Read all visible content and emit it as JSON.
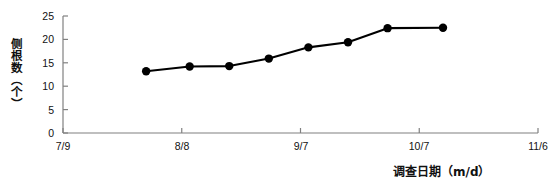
{
  "chart_data": {
    "type": "line",
    "title": "",
    "xlabel": "调查日期（m/d）",
    "ylabel": "侧根数（个）",
    "x_tick_labels": [
      "7/9",
      "8/8",
      "9/7",
      "10/7",
      "11/6"
    ],
    "x_tick_days": [
      0,
      30,
      60,
      90,
      120
    ],
    "xlim_labels": [
      "7/9",
      "11/6"
    ],
    "y_tick_labels": [
      "0",
      "5",
      "10",
      "15",
      "20",
      "25"
    ],
    "y_ticks": [
      0,
      5,
      10,
      15,
      20,
      25
    ],
    "ylim": [
      0,
      25
    ],
    "grid": false,
    "legend": "none",
    "marker": "filled-circle",
    "line_color": "#000000",
    "marker_color": "#000000",
    "axis_color": "#808080",
    "series": [
      {
        "name": "侧根数",
        "x_days": [
          21,
          32,
          42,
          52,
          62,
          72,
          82,
          96
        ],
        "x_dates": [
          "7/30",
          "8/10",
          "8/20",
          "8/30",
          "9/9",
          "9/19",
          "9/29",
          "10/13"
        ],
        "values": [
          13.2,
          14.2,
          14.3,
          15.9,
          18.3,
          19.4,
          22.4,
          22.5
        ]
      }
    ]
  }
}
